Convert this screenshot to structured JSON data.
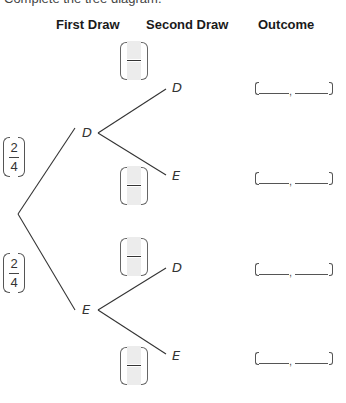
{
  "instruction_fragment": "Complete the tree diagram.",
  "headers": {
    "first_draw": "First Draw",
    "second_draw": "Second Draw",
    "outcome": "Outcome"
  },
  "first_draw": {
    "branches": [
      {
        "label": "D",
        "probability": {
          "numerator": "2",
          "denominator": "4"
        }
      },
      {
        "label": "E",
        "probability": {
          "numerator": "2",
          "denominator": "4"
        }
      }
    ]
  },
  "second_draw": {
    "branches": [
      {
        "parent": "D",
        "label": "D",
        "probability": {
          "numerator": "",
          "denominator": ""
        }
      },
      {
        "parent": "D",
        "label": "E",
        "probability": {
          "numerator": "",
          "denominator": ""
        }
      },
      {
        "parent": "E",
        "label": "D",
        "probability": {
          "numerator": "",
          "denominator": ""
        }
      },
      {
        "parent": "E",
        "label": "E",
        "probability": {
          "numerator": "",
          "denominator": ""
        }
      }
    ]
  },
  "outcomes": [
    {
      "first": "",
      "second": "",
      "separator": ","
    },
    {
      "first": "",
      "second": "",
      "separator": ","
    },
    {
      "first": "",
      "second": "",
      "separator": ","
    },
    {
      "first": "",
      "second": "",
      "separator": ","
    }
  ],
  "colors": {
    "line": "#333333",
    "answer_box": "#ececec",
    "text": "#222222"
  }
}
